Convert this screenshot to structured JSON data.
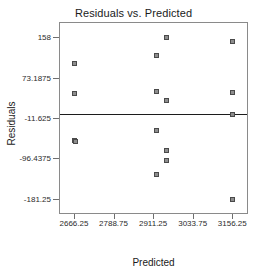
{
  "chart_data": {
    "type": "scatter",
    "title": "Residuals vs. Predicted",
    "xlabel": "Predicted",
    "ylabel": "Residuals",
    "grid": false,
    "legend": null,
    "xticks": [
      2666.25,
      2788.75,
      2911.25,
      3033.75,
      3156.25
    ],
    "xticklabels": [
      "2666.25",
      "2788.75",
      "2911.25",
      "3033.75",
      "3156.25"
    ],
    "yticks": [
      158,
      73.1875,
      -11.625,
      -96.4375,
      -181.25
    ],
    "yticklabels": [
      "158",
      "73.1875",
      "-11.625",
      "-96.4375",
      "-181.25"
    ],
    "xlim": [
      2620.0,
      3205.0
    ],
    "ylim": [
      -213.0,
      190.0
    ],
    "reference_line": {
      "orientation": "horizontal",
      "y": 0,
      "color": "#1c1c1c"
    },
    "marker": {
      "shape": "square",
      "fill": "#8d8d8d",
      "edge": "#4a4a4a",
      "size": 5
    },
    "points": [
      {
        "x": 2667.0,
        "y": 104.0
      },
      {
        "x": 2667.0,
        "y": 42.0
      },
      {
        "x": 2665.0,
        "y": -58.0
      },
      {
        "x": 2668.0,
        "y": -60.0
      },
      {
        "x": 2921.0,
        "y": 121.0
      },
      {
        "x": 2921.0,
        "y": 46.0
      },
      {
        "x": 2921.0,
        "y": -36.0
      },
      {
        "x": 2921.0,
        "y": -129.0
      },
      {
        "x": 2952.0,
        "y": 159.0
      },
      {
        "x": 2952.0,
        "y": 27.0
      },
      {
        "x": 2952.0,
        "y": -79.0
      },
      {
        "x": 2952.0,
        "y": -99.0
      },
      {
        "x": 3157.0,
        "y": 150.0
      },
      {
        "x": 3157.0,
        "y": 44.0
      },
      {
        "x": 3157.0,
        "y": -4.0
      },
      {
        "x": 3157.0,
        "y": -181.0
      }
    ]
  }
}
